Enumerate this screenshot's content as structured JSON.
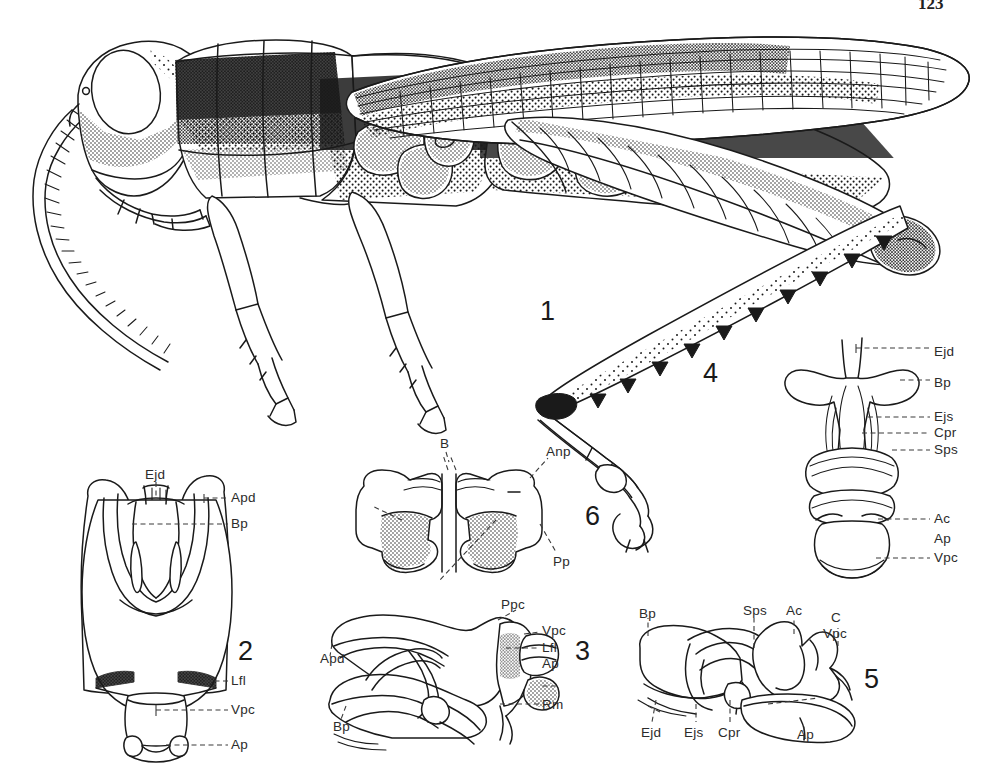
{
  "plate": {
    "page_number": "123",
    "caption_figures": [
      "1",
      "2",
      "3",
      "4",
      "5",
      "6"
    ]
  },
  "figures": [
    {
      "id": "fig1",
      "number": "1",
      "subject": "grasshopper-habitus-lateral",
      "number_pos": {
        "x": 540,
        "y": 298
      },
      "labels": []
    },
    {
      "id": "fig4",
      "number": "4",
      "subject": "hind-tibia-tarsus",
      "number_pos": {
        "x": 703,
        "y": 360
      },
      "labels": []
    },
    {
      "id": "fig7",
      "number": "",
      "subject": "phallic-complex-dorsal",
      "number_pos": null,
      "labels": [
        {
          "text": "Ejd",
          "x": 934,
          "y": 345
        },
        {
          "text": "Bp",
          "x": 934,
          "y": 376
        },
        {
          "text": "Ejs",
          "x": 934,
          "y": 413
        },
        {
          "text": "Cpr",
          "x": 934,
          "y": 429
        },
        {
          "text": "Sps",
          "x": 934,
          "y": 446
        },
        {
          "text": "Ac",
          "x": 934,
          "y": 515
        },
        {
          "text": "Ap",
          "x": 934,
          "y": 535
        },
        {
          "text": "Vpc",
          "x": 934,
          "y": 554
        }
      ]
    },
    {
      "id": "fig2",
      "number": "2",
      "subject": "phallic-complex-dorsal-view",
      "number_pos": {
        "x": 238,
        "y": 638
      },
      "labels": [
        {
          "text": "Ejd",
          "x": 148,
          "y": 470
        },
        {
          "text": "Apd",
          "x": 232,
          "y": 495
        },
        {
          "text": "Bp",
          "x": 232,
          "y": 521
        },
        {
          "text": "Lfl",
          "x": 232,
          "y": 678
        },
        {
          "text": "Vpc",
          "x": 232,
          "y": 707
        },
        {
          "text": "Ap",
          "x": 232,
          "y": 737
        }
      ]
    },
    {
      "id": "fig6",
      "number": "6",
      "subject": "epiphallus-dorsal",
      "number_pos": {
        "x": 585,
        "y": 503
      },
      "labels": [
        {
          "text": "B",
          "x": 441,
          "y": 440
        },
        {
          "text": "Anp",
          "x": 549,
          "y": 449
        },
        {
          "text": "Pp",
          "x": 556,
          "y": 558
        }
      ]
    },
    {
      "id": "fig3",
      "number": "3",
      "subject": "phallic-complex-lateral",
      "number_pos": {
        "x": 575,
        "y": 638
      },
      "labels": [
        {
          "text": "Ppc",
          "x": 503,
          "y": 604
        },
        {
          "text": "Vpc",
          "x": 543,
          "y": 629
        },
        {
          "text": "Lfl",
          "x": 543,
          "y": 645
        },
        {
          "text": "Ap",
          "x": 543,
          "y": 661
        },
        {
          "text": "Apd",
          "x": 325,
          "y": 655
        },
        {
          "text": "Rm",
          "x": 543,
          "y": 702
        },
        {
          "text": "Bp",
          "x": 337,
          "y": 723
        }
      ]
    },
    {
      "id": "fig5",
      "number": "5",
      "subject": "endophallus-lateral",
      "number_pos": {
        "x": 864,
        "y": 666
      },
      "labels": [
        {
          "text": "Bp",
          "x": 641,
          "y": 623
        },
        {
          "text": "Sps",
          "x": 747,
          "y": 605
        },
        {
          "text": "Ac",
          "x": 787,
          "y": 605
        },
        {
          "text": "C",
          "x": 829,
          "y": 614
        },
        {
          "text": "Vpc",
          "x": 823,
          "y": 629
        },
        {
          "text": "Ejd",
          "x": 647,
          "y": 729
        },
        {
          "text": "Ejs",
          "x": 689,
          "y": 729
        },
        {
          "text": "Cpr",
          "x": 722,
          "y": 729
        },
        {
          "text": "Ap",
          "x": 801,
          "y": 731
        }
      ]
    }
  ],
  "abbreviations": {
    "Ac": "aedeagal cleft",
    "Anp": "anterior projection",
    "Ap": "apodeme",
    "Apd": "apodeme of dorsal valve",
    "B": "bridge",
    "Bp": "basal plate",
    "C": "cingulum",
    "Cpr": "cingular process",
    "Ejd": "ejaculatory duct",
    "Ejs": "ejaculatory sac",
    "Lfl": "lateral flange",
    "Pp": "posterior projection",
    "Ppc": "posterior process of cingulum",
    "Rm": "ramus",
    "Sps": "spermatophore sac",
    "Vpc": "ventral plate of cingulum"
  },
  "colors": {
    "ink": "#1a1a1a",
    "label_ink": "#2b2b2b",
    "paper": "#ffffff"
  }
}
